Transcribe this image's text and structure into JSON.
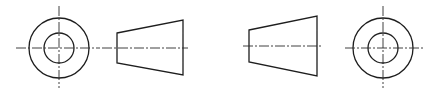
{
  "diagram": {
    "colors": {
      "line": "#1e1e1e",
      "centerline": "#2a2a2a",
      "background": "#ffffff"
    },
    "views": [
      {
        "name": "left-end-view",
        "type": "concentric-circles",
        "center": [
          59,
          48
        ],
        "outer_radius": 30,
        "inner_radius": 15,
        "centerlines": {
          "h": [
            16,
            100
          ],
          "v": [
            6,
            88
          ]
        }
      },
      {
        "name": "left-side-view",
        "type": "trapezoid",
        "points": [
          [
            117,
            33
          ],
          [
            183,
            20
          ],
          [
            183,
            75
          ],
          [
            117,
            63
          ]
        ],
        "centerline": {
          "y": 48,
          "x": [
            102,
            188
          ]
        }
      },
      {
        "name": "right-side-view",
        "type": "trapezoid",
        "points": [
          [
            249,
            30
          ],
          [
            317,
            16
          ],
          [
            317,
            76
          ],
          [
            249,
            62
          ]
        ],
        "centerline": {
          "y": 46,
          "x": [
            243,
            323
          ]
        }
      },
      {
        "name": "right-end-view",
        "type": "concentric-circles",
        "center": [
          383,
          48
        ],
        "outer_radius": 30,
        "inner_radius": 15,
        "centerlines": {
          "h": [
            345,
            423
          ],
          "v": [
            6,
            88
          ]
        }
      }
    ]
  }
}
